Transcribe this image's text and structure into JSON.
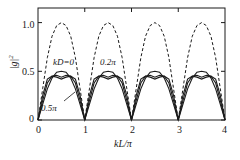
{
  "chart_data": {
    "type": "line",
    "title": "",
    "xlabel": "kL/π",
    "ylabel": "|g|²",
    "xlim": [
      0,
      4
    ],
    "ylim": [
      0,
      1.15
    ],
    "xticks": [
      "0",
      "1",
      "2",
      "3",
      "4"
    ],
    "xtick_values": [
      0,
      1,
      2,
      3,
      4
    ],
    "yticks": [
      "0",
      "0.5",
      "1.0"
    ],
    "ytick_values": [
      0,
      0.5,
      1.0
    ],
    "grid": false,
    "legend": "inline-annotations",
    "series": [
      {
        "name": "kD=0 (dashed envelope)",
        "style": "dashed",
        "peak": 1.0,
        "zeros": [
          0,
          1,
          2,
          3,
          4
        ],
        "x": [
          0,
          0.1,
          0.2,
          0.3,
          0.4,
          0.5,
          0.6,
          0.7,
          0.8,
          0.9,
          1.0
        ],
        "values": [
          0,
          0.32,
          0.64,
          0.86,
          0.97,
          1.0,
          0.97,
          0.86,
          0.64,
          0.32,
          0
        ]
      },
      {
        "name": "kD=0",
        "style": "solid",
        "peak": 0.5,
        "zeros": [
          0,
          1,
          2,
          3,
          4
        ],
        "x": [
          0,
          0.1,
          0.2,
          0.3,
          0.4,
          0.5,
          0.6,
          0.7,
          0.8,
          0.9,
          1.0
        ],
        "values": [
          0,
          0.16,
          0.32,
          0.43,
          0.49,
          0.5,
          0.49,
          0.43,
          0.32,
          0.16,
          0
        ]
      },
      {
        "name": "0.2π",
        "style": "solid",
        "peak": 0.47,
        "zeros": [
          0,
          1,
          2,
          3,
          4
        ],
        "x": [
          0,
          0.1,
          0.2,
          0.3,
          0.4,
          0.5,
          0.6,
          0.7,
          0.8,
          0.9,
          1.0
        ],
        "values": [
          0,
          0.2,
          0.38,
          0.45,
          0.46,
          0.44,
          0.46,
          0.45,
          0.38,
          0.2,
          0
        ]
      },
      {
        "name": "0.5π",
        "style": "solid",
        "peak": 0.45,
        "zeros": [
          0,
          1,
          2,
          3,
          4
        ],
        "x": [
          0,
          0.1,
          0.2,
          0.3,
          0.4,
          0.5,
          0.6,
          0.7,
          0.8,
          0.9,
          1.0
        ],
        "values": [
          0,
          0.25,
          0.42,
          0.45,
          0.44,
          0.42,
          0.44,
          0.45,
          0.42,
          0.25,
          0
        ]
      }
    ],
    "annotations": [
      {
        "text": "kD=0",
        "x": 0.42,
        "y": 0.63
      },
      {
        "text": "0.2π",
        "x": 1.18,
        "y": 0.63
      },
      {
        "text": "0.5π",
        "x": 0.28,
        "y": 0.12
      }
    ],
    "colors": {
      "line": "#1a1a1a",
      "axis": "#1a1a1a",
      "background": "#ffffff"
    }
  }
}
